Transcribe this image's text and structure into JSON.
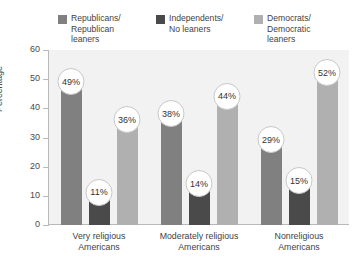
{
  "chart_data": {
    "type": "bar",
    "title": "",
    "xlabel": "",
    "ylabel": "Percentage",
    "ylim": [
      0,
      60
    ],
    "yticks": [
      0,
      10,
      20,
      30,
      40,
      50,
      60
    ],
    "grid": false,
    "legend_position": "top",
    "categories": [
      "Very religious\nAmericans",
      "Moderately religious\nAmericans",
      "Nonreligious\nAmericans"
    ],
    "series": [
      {
        "name": "Republicans/\nRepublican\nleaners",
        "color": "#808080",
        "values": [
          49,
          38,
          29
        ],
        "labels": [
          "49%",
          "38%",
          "29%"
        ]
      },
      {
        "name": "Independents/\nNo leaners",
        "color": "#4a4a4a",
        "values": [
          11,
          14,
          15
        ],
        "labels": [
          "11%",
          "14%",
          "15%"
        ]
      },
      {
        "name": "Democrats/\nDemocratic\nleaners",
        "color": "#b0b0b0",
        "values": [
          36,
          44,
          52
        ],
        "labels": [
          "36%",
          "44%",
          "52%"
        ]
      }
    ]
  },
  "colors": {
    "plot_background": "#f2f2f2",
    "page_background": "#ffffff",
    "axis": "#b9b9b9",
    "text": "#3f3f3f",
    "bubble_fill": "#ffffff",
    "bubble_border": "#c8c8c8"
  }
}
